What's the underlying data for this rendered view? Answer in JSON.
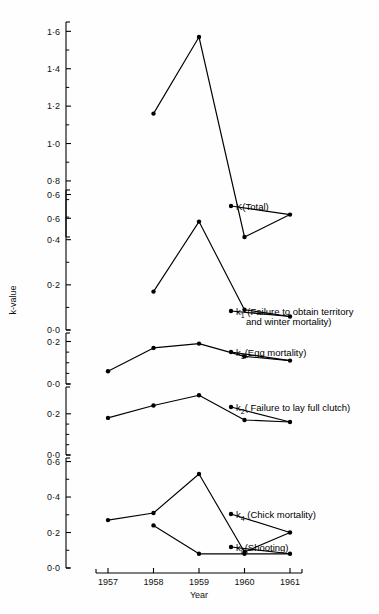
{
  "figure": {
    "ylabel": "k-value",
    "xlabel": "Year",
    "background": "#fefefe",
    "ink": "#000000"
  },
  "xaxis": {
    "ticks": [
      "1957",
      "1958",
      "1959",
      "1960",
      "1961"
    ],
    "values": [
      1957,
      1958,
      1959,
      1960,
      1961
    ]
  },
  "series_labels": {
    "k_total": "K(Total)",
    "k1_main": "k",
    "k1_sub": "1",
    "k1_rest": " (Failure to obtain territory",
    "k1_line2": "and winter mortality)",
    "k3_main": "k",
    "k3_sub": "3",
    "k3_rest": "(Egg mortality)",
    "k2_main": "k",
    "k2_sub": "2",
    "k2_rest": "( Failure to lay full clutch)",
    "k4_main": "k",
    "k4_sub": "4",
    "k4_rest": " (Chick mortality)",
    "k0_main": "k",
    "k0_sub": "0",
    "k0_rest": "(Shooting)"
  },
  "panels": {
    "p_total": {
      "ticks": [
        "1·6",
        "1·4",
        "1·2",
        "1·0",
        "0·8",
        "0·6"
      ],
      "tickvals": [
        1.6,
        1.4,
        1.2,
        1.0,
        0.8,
        0.6
      ]
    },
    "p_k1": {
      "ticks": [
        "0·6",
        "0·4",
        "0·2",
        "0·0"
      ],
      "tickvals": [
        0.6,
        0.4,
        0.2,
        0.0
      ]
    },
    "p_k3": {
      "ticks": [
        "0·2",
        "0·0"
      ],
      "tickvals": [
        0.2,
        0.0
      ]
    },
    "p_k2": {
      "ticks": [
        "0·2",
        "0·0"
      ],
      "tickvals": [
        0.2,
        0.0
      ]
    },
    "p_k4": {
      "ticks": [
        "0·6",
        "0·4",
        "0·2",
        "0·0"
      ],
      "tickvals": [
        0.6,
        0.4,
        0.2,
        0.0
      ]
    }
  },
  "chart_data": {
    "type": "line",
    "title": "",
    "xlabel": "Year",
    "ylabel": "k-value",
    "grid": false,
    "legend": "inline-right-of-last-point",
    "x": [
      1957,
      1958,
      1959,
      1960,
      1961
    ],
    "panels": [
      {
        "name": "K(Total)",
        "ylim": [
          0.5,
          1.65
        ],
        "yticks": [
          0.6,
          0.8,
          1.0,
          1.2,
          1.4,
          1.6
        ],
        "series": [
          {
            "name": "K(Total)",
            "x": [
              1958,
              1959,
              1960,
              1961
            ],
            "values": [
              1.16,
              1.57,
              0.5,
              0.62
            ]
          }
        ]
      },
      {
        "name": "k1",
        "ylim": [
          0.0,
          0.62
        ],
        "yticks": [
          0.0,
          0.2,
          0.4,
          0.6
        ],
        "series": [
          {
            "name": "k1 (Failure to obtain territory and winter mortality)",
            "x": [
              1958,
              1959,
              1960,
              1961
            ],
            "values": [
              0.17,
              0.48,
              0.09,
              0.06
            ]
          }
        ]
      },
      {
        "name": "k3",
        "ylim": [
          0.0,
          0.24
        ],
        "yticks": [
          0.0,
          0.2
        ],
        "series": [
          {
            "name": "k3 (Egg mortality)",
            "x": [
              1957,
              1958,
              1959,
              1960,
              1961
            ],
            "values": [
              0.06,
              0.17,
              0.19,
              0.13,
              0.11
            ]
          }
        ]
      },
      {
        "name": "k2",
        "ylim": [
          0.0,
          0.33
        ],
        "yticks": [
          0.0,
          0.2
        ],
        "series": [
          {
            "name": "k2 (Failure to lay full clutch)",
            "x": [
              1957,
              1958,
              1959,
              1960,
              1961
            ],
            "values": [
              0.18,
              0.24,
              0.29,
              0.17,
              0.16
            ]
          }
        ]
      },
      {
        "name": "k4_k0",
        "ylim": [
          0.0,
          0.62
        ],
        "yticks": [
          0.0,
          0.2,
          0.4,
          0.6
        ],
        "series": [
          {
            "name": "k4 (Chick mortality)",
            "x": [
              1957,
              1958,
              1959,
              1960,
              1961
            ],
            "values": [
              0.27,
              0.31,
              0.53,
              0.09,
              0.2
            ]
          },
          {
            "name": "k0 (Shooting)",
            "x": [
              1958,
              1959,
              1960,
              1961
            ],
            "values": [
              0.24,
              0.08,
              0.08,
              0.08
            ]
          }
        ]
      }
    ]
  }
}
